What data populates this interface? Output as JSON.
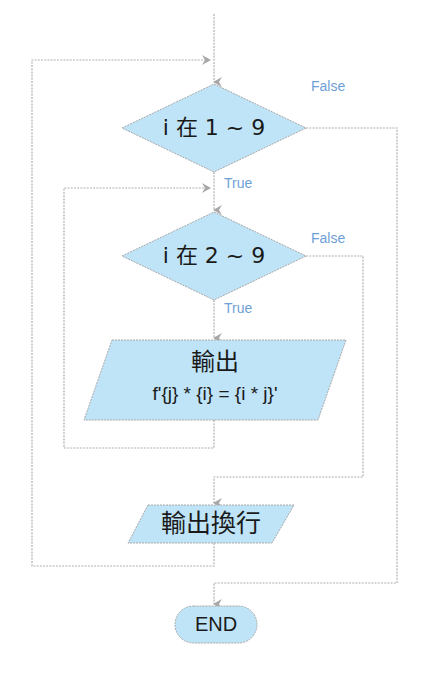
{
  "diagram": {
    "type": "flowchart",
    "colors": {
      "shape_fill": "#bfe4f7",
      "shape_stroke": "#a8a8a8",
      "connector": "#b0b0b0",
      "label": "#6f9fd8",
      "text": "#1a1a1a"
    },
    "nodes": {
      "outer_condition": {
        "shape": "diamond",
        "text": "i 在 1 ~ 9"
      },
      "inner_condition": {
        "shape": "diamond",
        "text": "i 在 2 ~ 9"
      },
      "print_product": {
        "shape": "parallelogram",
        "line1": "輸出",
        "line2": "f'{j} * {i} = {i * j}'"
      },
      "print_newline": {
        "shape": "parallelogram",
        "text": "輸出換行"
      },
      "end": {
        "shape": "terminator",
        "text": "END"
      }
    },
    "labels": {
      "outer_true": "True",
      "outer_false": "False",
      "inner_true": "True",
      "inner_false": "False"
    }
  }
}
